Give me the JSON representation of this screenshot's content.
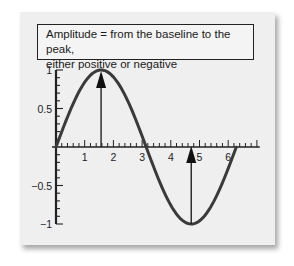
{
  "callout": {
    "line1": "Amplitude = from the baseline to the peak,",
    "line2": "either positive or negative"
  },
  "colors": {
    "card": "#efefef",
    "curve": "#3a3a3a",
    "axis": "#222222"
  },
  "chart_data": {
    "type": "line",
    "title": "Amplitude = from the baseline to the peak, either positive or negative",
    "function": "y = sin(x)",
    "x_range": [
      0,
      6.28
    ],
    "xlim": [
      0,
      7.1
    ],
    "ylim": [
      -1,
      1
    ],
    "x_ticks": [
      "1",
      "2",
      "3",
      "4",
      "5",
      "6"
    ],
    "y_ticks": [
      "1",
      "0.5",
      "-0.5",
      "-1"
    ],
    "series": [
      {
        "name": "sine wave",
        "x": [
          0,
          0.785,
          1.571,
          2.356,
          3.142,
          3.927,
          4.712,
          5.498,
          6.283
        ],
        "values": [
          0,
          0.707,
          1,
          0.707,
          0,
          -0.707,
          -1,
          -0.707,
          0
        ]
      }
    ],
    "annotations": [
      {
        "type": "arrow",
        "from": [
          1.571,
          0
        ],
        "to": [
          1.571,
          1
        ],
        "label": "positive amplitude"
      },
      {
        "type": "arrow",
        "from": [
          4.712,
          -1
        ],
        "to": [
          4.712,
          0
        ],
        "label": "negative amplitude"
      }
    ],
    "grid": false
  }
}
